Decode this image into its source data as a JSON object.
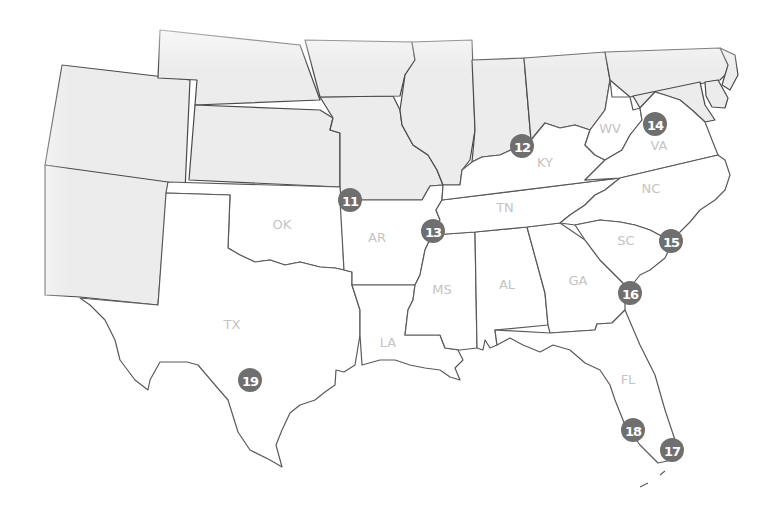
{
  "map": {
    "title": "",
    "region": "Southern United States",
    "colors": {
      "marker_fill": "#6f6f6f",
      "marker_text": "#ffffff",
      "label_text": "#c4c4c4",
      "highlight_state_fill": "#ffffff",
      "context_state_fill": "#ececec",
      "border": "#4a4a4a"
    },
    "state_labels": [
      {
        "id": "OK",
        "label": "OK",
        "x": 282,
        "y": 229
      },
      {
        "id": "AR",
        "label": "AR",
        "x": 377,
        "y": 242
      },
      {
        "id": "TX",
        "label": "TX",
        "x": 232,
        "y": 329
      },
      {
        "id": "LA",
        "label": "LA",
        "x": 388,
        "y": 347
      },
      {
        "id": "MS",
        "label": "MS",
        "x": 442,
        "y": 294
      },
      {
        "id": "AL",
        "label": "AL",
        "x": 507,
        "y": 289
      },
      {
        "id": "GA",
        "label": "GA",
        "x": 578,
        "y": 285
      },
      {
        "id": "TN",
        "label": "TN",
        "x": 505,
        "y": 212
      },
      {
        "id": "KY",
        "label": "KY",
        "x": 545,
        "y": 167
      },
      {
        "id": "WV",
        "label": "WV",
        "x": 610,
        "y": 133
      },
      {
        "id": "VA",
        "label": "VA",
        "x": 659,
        "y": 150
      },
      {
        "id": "NC",
        "label": "NC",
        "x": 651,
        "y": 193
      },
      {
        "id": "SC",
        "label": "SC",
        "x": 626,
        "y": 245
      },
      {
        "id": "FL",
        "label": "FL",
        "x": 628,
        "y": 384
      }
    ],
    "markers": [
      {
        "number": "11",
        "x": 350,
        "y": 200
      },
      {
        "number": "12",
        "x": 522,
        "y": 146
      },
      {
        "number": "13",
        "x": 433,
        "y": 231
      },
      {
        "number": "14",
        "x": 655,
        "y": 124
      },
      {
        "number": "15",
        "x": 671,
        "y": 241
      },
      {
        "number": "16",
        "x": 630,
        "y": 293
      },
      {
        "number": "17",
        "x": 672,
        "y": 450
      },
      {
        "number": "18",
        "x": 633,
        "y": 430
      },
      {
        "number": "19",
        "x": 250,
        "y": 380
      }
    ]
  }
}
